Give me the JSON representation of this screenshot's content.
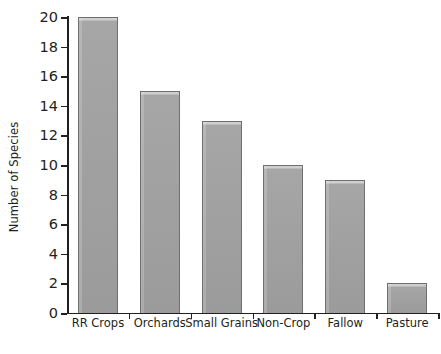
{
  "chart_data": {
    "type": "bar",
    "title": "",
    "xlabel": "",
    "ylabel": "Number of Species",
    "categories": [
      "RR Crops",
      "Orchards",
      "Small Grains",
      "Non-Crop",
      "Fallow",
      "Pasture"
    ],
    "values": [
      20,
      15,
      13,
      10,
      9,
      2
    ],
    "ylim": [
      0,
      20
    ],
    "ytick_values": [
      0,
      2,
      4,
      6,
      8,
      10,
      12,
      14,
      16,
      18,
      20
    ],
    "ytick_labels": [
      "0",
      "2",
      "4",
      "6",
      "8",
      "10",
      "12",
      "14",
      "16",
      "18",
      "20"
    ],
    "grid": false,
    "legend": false,
    "orientation": "vertical",
    "bar_color": "#9b9b9b",
    "bar_edge_color": "#6f6f6f",
    "axis_color": "#231f20",
    "background_color": "#ffffff"
  }
}
